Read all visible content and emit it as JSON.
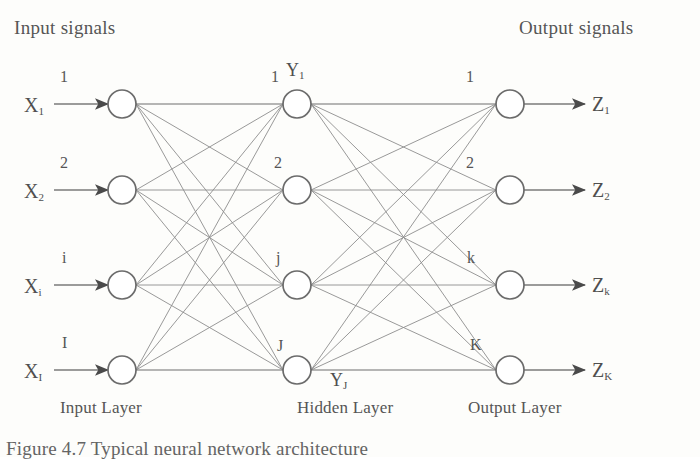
{
  "figure": {
    "caption": "Figure 4.7 Typical neural network architecture",
    "header_left": "Input signals",
    "header_right": "Output signals"
  },
  "layers": {
    "input": {
      "name": "Input Layer",
      "nodes": [
        {
          "index_label": "1",
          "signal_base": "X",
          "signal_sub": "1"
        },
        {
          "index_label": "2",
          "signal_base": "X",
          "signal_sub": "2"
        },
        {
          "index_label": "i",
          "signal_base": "X",
          "signal_sub": "i"
        },
        {
          "index_label": "I",
          "signal_base": "X",
          "signal_sub": "I"
        }
      ]
    },
    "hidden": {
      "name": "Hidden Layer",
      "first_node_output_base": "Y",
      "first_node_output_sub": "1",
      "last_node_output_base": "Y",
      "last_node_output_sub": "J",
      "nodes": [
        {
          "index_label": "1"
        },
        {
          "index_label": "2"
        },
        {
          "index_label": "j"
        },
        {
          "index_label": "J"
        }
      ]
    },
    "output": {
      "name": "Output Layer",
      "nodes": [
        {
          "index_label": "1",
          "signal_base": "Z",
          "signal_sub": "1"
        },
        {
          "index_label": "2",
          "signal_base": "Z",
          "signal_sub": "2"
        },
        {
          "index_label": "k",
          "signal_base": "Z",
          "signal_sub": "k"
        },
        {
          "index_label": "K",
          "signal_base": "Z",
          "signal_sub": "K"
        }
      ]
    }
  },
  "colors": {
    "ink": "#4a4a4a",
    "line": "#8d8d8d",
    "node_stroke": "#6b6b6b",
    "paper": "#fdfdfb"
  },
  "geometry": {
    "node_radius": 14,
    "input_x": 122,
    "hidden_x": 297,
    "output_x": 510,
    "rows_y": [
      104,
      190,
      285,
      370
    ]
  }
}
